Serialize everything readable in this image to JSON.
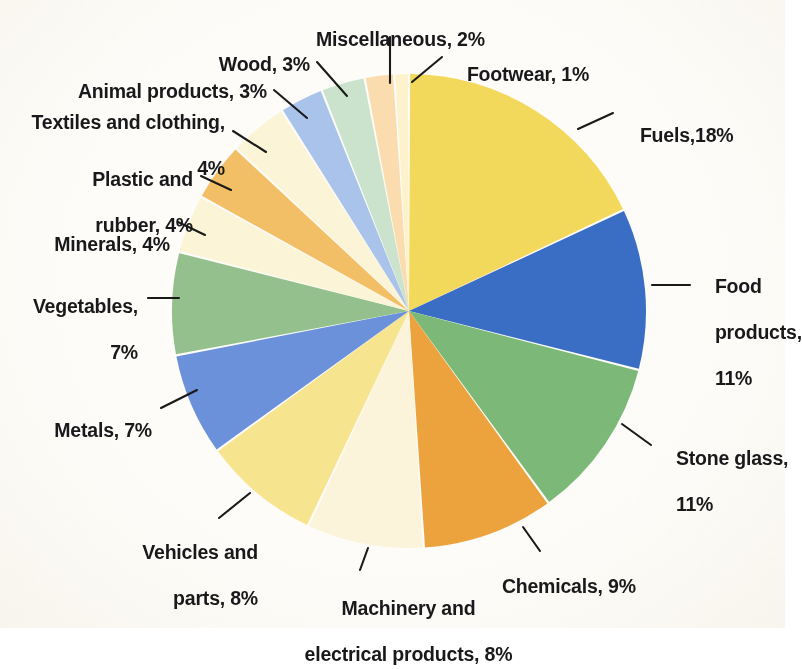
{
  "chart_data": {
    "type": "pie",
    "title": "",
    "subtitle": "",
    "xlabel": "",
    "ylabel": "",
    "legend_position": "none",
    "grid": false,
    "units": "percent",
    "total": 100,
    "start_angle_deg": 0,
    "direction": "clockwise",
    "center": {
      "x": 409,
      "y": 311
    },
    "radius": 237,
    "categories": [
      "Fuels",
      "Food products",
      "Stone glass",
      "Chemicals",
      "Machinery and electrical products",
      "Vehicles and parts",
      "Metals",
      "Vegetables",
      "Minerals",
      "Plastic and rubber",
      "Textiles and clothing",
      "Animal products",
      "Wood",
      "Miscellaneous",
      "Footwear"
    ],
    "values": [
      18,
      11,
      11,
      9,
      8,
      8,
      7,
      7,
      4,
      4,
      4,
      3,
      3,
      2,
      1
    ],
    "colors": [
      "#f2d95c",
      "#3a6ec4",
      "#7cb878",
      "#eca33d",
      "#fbf4da",
      "#f6e48f",
      "#6b91da",
      "#93c08c",
      "#fbf4d6",
      "#f2bf66",
      "#fbf4d6",
      "#aac3ea",
      "#cbe3cc",
      "#fbdcaf",
      "#fdf2cc"
    ],
    "slices": [
      {
        "label": "Fuels",
        "value": 18,
        "color": "#f2d95c"
      },
      {
        "label": "Food products",
        "value": 11,
        "color": "#3a6ec4"
      },
      {
        "label": "Stone glass",
        "value": 11,
        "color": "#7cb878"
      },
      {
        "label": "Chemicals",
        "value": 9,
        "color": "#eca33d"
      },
      {
        "label": "Machinery and electrical products",
        "value": 8,
        "color": "#fbf4da"
      },
      {
        "label": "Vehicles and parts",
        "value": 8,
        "color": "#f6e48f"
      },
      {
        "label": "Metals",
        "value": 7,
        "color": "#6b91da"
      },
      {
        "label": "Vegetables",
        "value": 7,
        "color": "#93c08c"
      },
      {
        "label": "Minerals",
        "value": 4,
        "color": "#fbf4d6"
      },
      {
        "label": "Plastic and rubber",
        "value": 4,
        "color": "#f2bf66"
      },
      {
        "label": "Textiles and clothing",
        "value": 4,
        "color": "#fbf4d6"
      },
      {
        "label": "Animal products",
        "value": 3,
        "color": "#aac3ea"
      },
      {
        "label": "Wood",
        "value": 3,
        "color": "#cbe3cc"
      },
      {
        "label": "Miscellaneous",
        "value": 2,
        "color": "#fbdcaf"
      },
      {
        "label": "Footwear",
        "value": 1,
        "color": "#fdf2cc"
      }
    ]
  },
  "labels": {
    "fuels": "Fuels,18%",
    "food_products_line1": "Food",
    "food_products_line2": "products,",
    "food_products_line3": "11%",
    "stone_glass_line1": "Stone glass,",
    "stone_glass_line2": "11%",
    "chemicals": "Chemicals, 9%",
    "machinery_line1": "Machinery and",
    "machinery_line2": "electrical products, 8%",
    "vehicles_line1": "Vehicles and",
    "vehicles_line2": "parts, 8%",
    "metals": "Metals, 7%",
    "vegetables_line1": "Vegetables,",
    "vegetables_line2": "7%",
    "minerals": "Minerals, 4%",
    "plastic_line1": "Plastic and",
    "plastic_line2": "rubber, 4%",
    "textiles_line1": "Textiles and clothing,",
    "textiles_line2": "4%",
    "animal_products": "Animal products, 3%",
    "wood": "Wood, 3%",
    "miscellaneous": "Miscellaneous, 2%",
    "footwear": "Footwear, 1%"
  }
}
